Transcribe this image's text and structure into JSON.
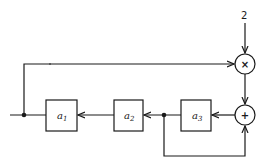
{
  "diagram": {
    "type": "block-diagram",
    "input": {
      "label": "2"
    },
    "nodes": [
      {
        "id": "mult",
        "symbol": "×",
        "kind": "multiplier"
      },
      {
        "id": "add",
        "symbol": "+",
        "kind": "adder"
      }
    ],
    "blocks": [
      {
        "id": "a1",
        "base": "a",
        "sub": "1"
      },
      {
        "id": "a2",
        "base": "a",
        "sub": "2"
      },
      {
        "id": "a3",
        "base": "a",
        "sub": "3"
      }
    ]
  }
}
